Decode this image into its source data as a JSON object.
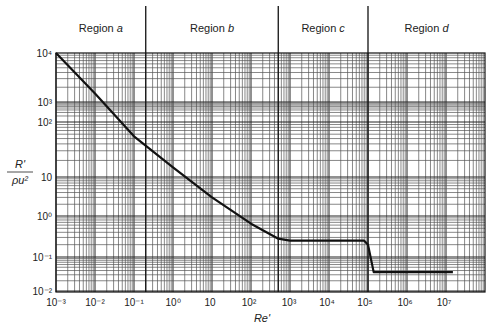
{
  "chart_data": {
    "type": "line",
    "title": "",
    "xlabel": "Re'",
    "ylabel": "R' / ρu²",
    "x_scale": "log",
    "y_scale": "log",
    "xlim": [
      0.001,
      100000000
    ],
    "ylim": [
      0.01,
      10000
    ],
    "grid": true,
    "legend": null,
    "x_ticks": [
      {
        "value": 0.001,
        "label": "10⁻³",
        "px": 56
      },
      {
        "value": 0.01,
        "label": "10⁻²",
        "px": 95
      },
      {
        "value": 0.1,
        "label": "10⁻¹",
        "px": 134
      },
      {
        "value": 1,
        "label": "10⁰",
        "px": 173
      },
      {
        "value": 10,
        "label": "10",
        "px": 210
      },
      {
        "value": 100,
        "label": "10²",
        "px": 249
      },
      {
        "value": 1000,
        "label": "10³",
        "px": 289
      },
      {
        "value": 10000,
        "label": "10⁴",
        "px": 327
      },
      {
        "value": 100000,
        "label": "10⁵",
        "px": 365
      },
      {
        "value": 1000000,
        "label": "10⁶",
        "px": 405
      },
      {
        "value": 10000000,
        "label": "10⁷",
        "px": 444
      }
    ],
    "y_ticks": [
      {
        "value": 10000,
        "label": "10⁴",
        "px": 53
      },
      {
        "value": 1000,
        "label": "10³",
        "px": 102
      },
      {
        "value": 100,
        "label": "10²",
        "px": 122
      },
      {
        "value": 10,
        "label": "10",
        "px": 177
      },
      {
        "value": 1,
        "label": "10⁰",
        "px": 216
      },
      {
        "value": 0.1,
        "label": "10⁻¹",
        "px": 257
      },
      {
        "value": 0.01,
        "label": "10⁻²",
        "px": 291
      }
    ],
    "regions": [
      {
        "name": "Region a",
        "letter": "a",
        "x_start": 0.001,
        "x_end": 0.2
      },
      {
        "name": "Region b",
        "letter": "b",
        "x_start": 0.2,
        "x_end": 500
      },
      {
        "name": "Region c",
        "letter": "c",
        "x_start": 500,
        "x_end": 100000
      },
      {
        "name": "Region d",
        "letter": "d",
        "x_start": 100000,
        "x_end": 100000000
      }
    ],
    "region_dividers": [
      0.2,
      500,
      100000
    ],
    "series": [
      {
        "name": "R'/ρu² vs Re'",
        "x": [
          0.001,
          0.01,
          0.1,
          1,
          10,
          100,
          500,
          1000,
          10000,
          80000,
          100000,
          140000,
          1000000,
          15000000
        ],
        "y": [
          10000,
          1500,
          55,
          15,
          3,
          0.65,
          0.28,
          0.25,
          0.25,
          0.25,
          0.2,
          0.036,
          0.036,
          0.036
        ]
      }
    ]
  },
  "labels": {
    "region_prefix": "Region",
    "xlabel_text": "Re'",
    "ylabel_numer": "R'",
    "ylabel_denom": "ρu²"
  }
}
